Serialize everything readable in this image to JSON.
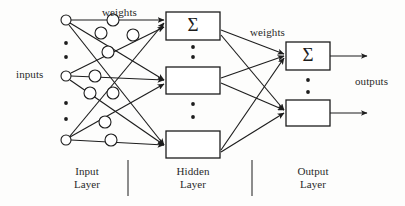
{
  "figure": {
    "type": "neural-network-architecture-diagram",
    "title": "",
    "background_color": "#fdfdfc",
    "stroke_color": "#1d1d1d"
  },
  "labels": {
    "inputs": "inputs",
    "outputs": "outputs",
    "weights_input_hidden": "weights",
    "weights_hidden_output": "weights",
    "summation_symbol": "Σ"
  },
  "layers": [
    {
      "id": "input",
      "name_line1": "Input",
      "name_line2": "Layer"
    },
    {
      "id": "hidden",
      "name_line1": "Hidden",
      "name_line2": "Layer"
    },
    {
      "id": "output",
      "name_line1": "Output",
      "name_line2": "Layer"
    }
  ],
  "input_nodes": [
    {
      "id": "in-1",
      "cx": 66,
      "cy": 20,
      "r": 5
    },
    {
      "id": "in-2",
      "cx": 66,
      "cy": 76,
      "r": 5
    },
    {
      "id": "in-3",
      "cx": 66,
      "cy": 140,
      "r": 5
    }
  ],
  "input_ellipsis_dots": [
    {
      "cx": 66,
      "cy": 43
    },
    {
      "cx": 66,
      "cy": 57
    },
    {
      "cx": 66,
      "cy": 103
    },
    {
      "cx": 66,
      "cy": 119
    }
  ],
  "weight_nodes": [
    {
      "id": "w-1-1",
      "cx": 113,
      "cy": 20,
      "r": 6
    },
    {
      "id": "w-1-2",
      "cx": 101,
      "cy": 33,
      "r": 6
    },
    {
      "id": "w-1-3",
      "cx": 133,
      "cy": 35,
      "r": 6
    },
    {
      "id": "w-2-1",
      "cx": 108,
      "cy": 52,
      "r": 6
    },
    {
      "id": "w-2-2",
      "cx": 95,
      "cy": 76,
      "r": 6
    },
    {
      "id": "w-2-3",
      "cx": 90,
      "cy": 93,
      "r": 6
    },
    {
      "id": "w-3-1",
      "cx": 113,
      "cy": 93,
      "r": 6
    },
    {
      "id": "w-3-2",
      "cx": 105,
      "cy": 122,
      "r": 6
    },
    {
      "id": "w-3-3",
      "cx": 111,
      "cy": 140,
      "r": 6
    }
  ],
  "hidden_nodes": [
    {
      "id": "hid-1",
      "x": 166,
      "y": 12,
      "w": 54,
      "h": 28,
      "symbol": "Σ"
    },
    {
      "id": "hid-2",
      "x": 166,
      "y": 67,
      "w": 54,
      "h": 27,
      "symbol": ""
    },
    {
      "id": "hid-3",
      "x": 166,
      "y": 131,
      "w": 54,
      "h": 27,
      "symbol": ""
    }
  ],
  "hidden_ellipsis_dots": [
    {
      "cx": 193,
      "cy": 47
    },
    {
      "cx": 193,
      "cy": 57
    },
    {
      "cx": 193,
      "cy": 104
    },
    {
      "cx": 193,
      "cy": 117
    }
  ],
  "output_nodes": [
    {
      "id": "out-1",
      "x": 286,
      "y": 42,
      "w": 44,
      "h": 28,
      "symbol": "Σ"
    },
    {
      "id": "out-2",
      "x": 286,
      "y": 100,
      "w": 44,
      "h": 26,
      "symbol": ""
    }
  ],
  "output_ellipsis_dots": [
    {
      "cx": 308,
      "cy": 80
    },
    {
      "cx": 308,
      "cy": 92
    }
  ],
  "output_arrows": [
    {
      "id": "out-arrow-1",
      "x1": 330,
      "y1": 56,
      "x2": 367,
      "y2": 56
    },
    {
      "id": "out-arrow-2",
      "x1": 330,
      "y1": 113,
      "x2": 367,
      "y2": 113
    }
  ],
  "input_to_hidden_edges": [
    {
      "from": "in-1",
      "to": "hid-1",
      "x1": 71,
      "y1": 20,
      "x2": 164,
      "y2": 20
    },
    {
      "from": "in-1",
      "to": "hid-2",
      "x1": 70,
      "y1": 23,
      "x2": 164,
      "y2": 80
    },
    {
      "from": "in-1",
      "to": "hid-3",
      "x1": 69,
      "y1": 25,
      "x2": 164,
      "y2": 145
    },
    {
      "from": "in-2",
      "to": "hid-1",
      "x1": 71,
      "y1": 73,
      "x2": 164,
      "y2": 27
    },
    {
      "from": "in-2",
      "to": "hid-2",
      "x1": 71,
      "y1": 76,
      "x2": 164,
      "y2": 80
    },
    {
      "from": "in-2",
      "to": "hid-3",
      "x1": 70,
      "y1": 80,
      "x2": 164,
      "y2": 145
    },
    {
      "from": "in-3",
      "to": "hid-1",
      "x1": 70,
      "y1": 136,
      "x2": 164,
      "y2": 23
    },
    {
      "from": "in-3",
      "to": "hid-2",
      "x1": 70,
      "y1": 137,
      "x2": 164,
      "y2": 84
    },
    {
      "from": "in-3",
      "to": "hid-3",
      "x1": 71,
      "y1": 140,
      "x2": 164,
      "y2": 145
    }
  ],
  "hidden_to_output_edges": [
    {
      "from": "hid-1",
      "to": "out-1",
      "x1": 221,
      "y1": 30,
      "x2": 284,
      "y2": 54
    },
    {
      "from": "hid-1",
      "to": "out-2",
      "x1": 221,
      "y1": 35,
      "x2": 284,
      "y2": 110
    },
    {
      "from": "hid-2",
      "to": "out-1",
      "x1": 221,
      "y1": 78,
      "x2": 284,
      "y2": 56
    },
    {
      "from": "hid-2",
      "to": "out-2",
      "x1": 221,
      "y1": 83,
      "x2": 284,
      "y2": 110
    },
    {
      "from": "hid-3",
      "to": "out-1",
      "x1": 221,
      "y1": 150,
      "x2": 284,
      "y2": 58
    },
    {
      "from": "hid-3",
      "to": "out-2",
      "x1": 221,
      "y1": 152,
      "x2": 284,
      "y2": 113
    }
  ],
  "layer_dividers": [
    {
      "id": "divider-input-hidden",
      "x": 128,
      "y1": 160,
      "y2": 196
    },
    {
      "id": "divider-hidden-output",
      "x": 252,
      "y1": 160,
      "y2": 196
    }
  ],
  "label_positions": {
    "inputs": {
      "left": 16,
      "top": 68
    },
    "outputs": {
      "left": 355,
      "top": 75
    },
    "weights_1": {
      "left": 102,
      "top": 6
    },
    "weights_2": {
      "left": 250,
      "top": 26
    },
    "layer_input": {
      "left": 58,
      "top": 165,
      "width": 58
    },
    "layer_hidden": {
      "left": 163,
      "top": 165,
      "width": 60
    },
    "layer_output": {
      "left": 283,
      "top": 165,
      "width": 60
    }
  }
}
